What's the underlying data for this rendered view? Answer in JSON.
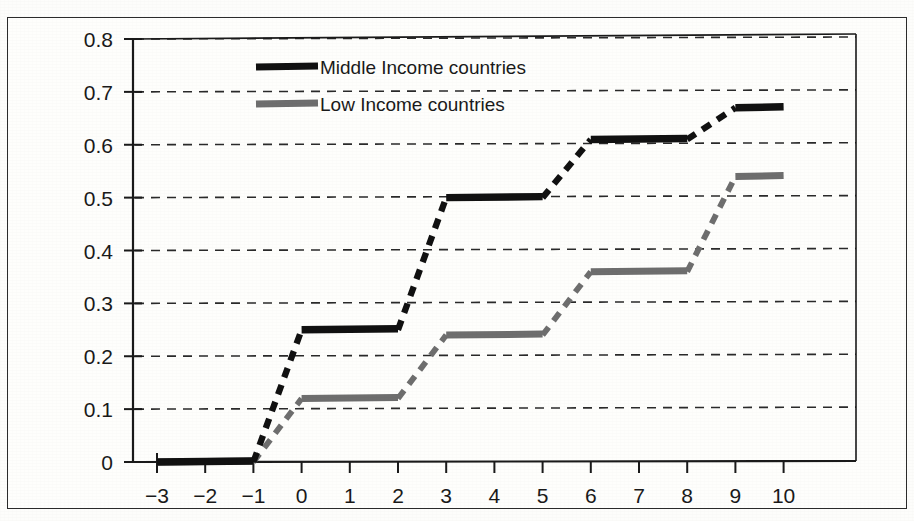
{
  "chart_data": {
    "type": "line",
    "title": "",
    "subtitle": "",
    "xlabel": "",
    "ylabel": "",
    "xlim": [
      -3.5,
      10.8
    ],
    "ylim": [
      0,
      0.8
    ],
    "grid": true,
    "grid_style": "dashed-horizontal",
    "legend_position": "top-center",
    "x_ticks": [
      "-3",
      "-2",
      "-1",
      "0",
      "1",
      "2",
      "3",
      "4",
      "5",
      "6",
      "7",
      "8",
      "9",
      "10"
    ],
    "x_tick_values": [
      -3,
      -2,
      -1,
      0,
      1,
      2,
      3,
      4,
      5,
      6,
      7,
      8,
      9,
      10
    ],
    "y_ticks": [
      "0",
      "0.1",
      "0.2",
      "0.3",
      "0.4",
      "0.5",
      "0.6",
      "0.7",
      "0.8"
    ],
    "y_tick_values": [
      0,
      0.1,
      0.2,
      0.3,
      0.4,
      0.5,
      0.6,
      0.7,
      0.8
    ],
    "x": [
      -3,
      -2,
      -1,
      0,
      1,
      2,
      3,
      4,
      5,
      6,
      7,
      8,
      9,
      10
    ],
    "series": [
      {
        "name": "Middle Income countries",
        "color": "#111111",
        "values": [
          0,
          0,
          0,
          0.25,
          0.25,
          0.25,
          0.5,
          0.5,
          0.5,
          0.61,
          0.61,
          0.61,
          0.67,
          0.67
        ]
      },
      {
        "name": "Low Income countries",
        "color": "#6e6e6e",
        "values": [
          0,
          0,
          0,
          0.12,
          0.12,
          0.12,
          0.24,
          0.24,
          0.24,
          0.36,
          0.36,
          0.36,
          0.54,
          0.54
        ]
      }
    ]
  },
  "legend": {
    "entries": [
      {
        "label": "Middle Income countries",
        "swatch": "legend-swatch-black",
        "color": "#111111"
      },
      {
        "label": "Low Income countries",
        "swatch": "legend-swatch-gray",
        "color": "#6e6e6e"
      }
    ]
  },
  "axis": {
    "y_labels": [
      "0.8",
      "0.7",
      "0.6",
      "0.5",
      "0.4",
      "0.3",
      "0.2",
      "0.1",
      "0"
    ],
    "x_labels": [
      "-3",
      "-2",
      "-1",
      "0",
      "1",
      "2",
      "3",
      "4",
      "5",
      "6",
      "7",
      "8",
      "9",
      "10"
    ]
  },
  "colors": {
    "axis": "#1a1a1a",
    "grid": "#2a2a2a",
    "frame": "#2b2b2b",
    "series_middle": "#111111",
    "series_low": "#6e6e6e",
    "background": "#fefefc"
  }
}
